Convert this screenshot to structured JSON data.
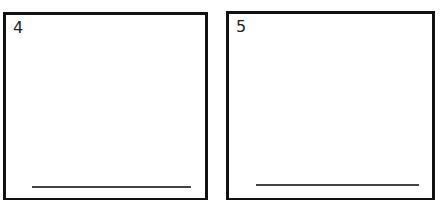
{
  "boxes": [
    {
      "label": "4"
    },
    {
      "label": "5"
    }
  ],
  "colors": {
    "border": "#111111",
    "line": "#444444",
    "background": "#ffffff"
  }
}
